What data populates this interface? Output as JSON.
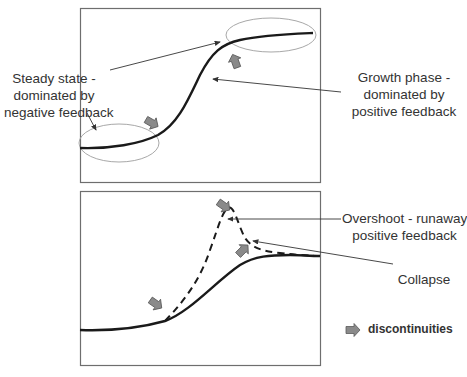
{
  "top_panel": {
    "labels": {
      "steady_state": [
        "Steady state -",
        "dominated by",
        "negative feedback"
      ],
      "growth_phase": [
        "Growth phase -",
        "dominated by",
        "positive  feedback"
      ]
    }
  },
  "bottom_panel": {
    "labels": {
      "overshoot": [
        "Overshoot - runaway",
        "positive feedback"
      ],
      "collapse": "Collapse"
    }
  },
  "legend": {
    "icon": "block-arrow-icon",
    "label": "discontinuities"
  },
  "colors": {
    "frame": "#6e6e6e",
    "curve": "#1a1a1a",
    "ellipse": "#a0a0a0",
    "arrow_fill": "#8a8a8a",
    "text": "#333333"
  }
}
